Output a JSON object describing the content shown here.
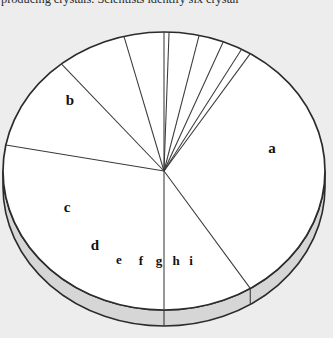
{
  "caption": {
    "text": "producing crystals. Scientists identify six crystal"
  },
  "chart": {
    "title": "",
    "center": {
      "x": 164,
      "y": 171
    },
    "radius_x": 161,
    "radius_y": 139,
    "depth": 16,
    "colors": {
      "top_face": "#ffffff",
      "rim_face": "#d6d6d6",
      "outline": "#2b2b2b",
      "divider": "#3a3a3a",
      "background": "#ededed"
    }
  },
  "chart_data": {
    "type": "pie",
    "title": "",
    "xlabel": "",
    "ylabel": "",
    "legend": "none",
    "start_angle_deg": -90,
    "direction": "clockwise",
    "labels": [
      "a",
      "b",
      "c",
      "d",
      "e",
      "f",
      "g",
      "h",
      "i"
    ],
    "values": [
      41,
      28,
      11,
      7,
      4.5,
      3,
      2.5,
      2,
      1
    ],
    "slices": [
      {
        "label": "a",
        "value": 41,
        "start_deg": -90,
        "end_deg": 57.6,
        "label_x": 272,
        "label_y": 153
      },
      {
        "label": "b",
        "value": 28,
        "start_deg": 90,
        "end_deg": 190.8,
        "label_x": 70,
        "label_y": 105
      },
      {
        "label": "c",
        "value": 11,
        "start_deg": 190.8,
        "end_deg": 230.4,
        "label_x": 67,
        "label_y": 212
      },
      {
        "label": "d",
        "value": 7,
        "start_deg": 230.4,
        "end_deg": 255.6,
        "label_x": 95,
        "label_y": 250
      },
      {
        "label": "e",
        "value": 4.5,
        "start_deg": 255.6,
        "end_deg": 271.8,
        "label_x": 119,
        "label_y": 264
      },
      {
        "label": "f",
        "value": 3,
        "start_deg": 271.8,
        "end_deg": 282.6,
        "label_x": 141,
        "label_y": 265
      },
      {
        "label": "g",
        "value": 2.5,
        "start_deg": 282.6,
        "end_deg": 291.6,
        "label_x": 159,
        "label_y": 265
      },
      {
        "label": "h",
        "value": 2,
        "start_deg": 291.6,
        "end_deg": 298.8,
        "label_x": 176,
        "label_y": 265
      },
      {
        "label": "i",
        "value": 1,
        "start_deg": 298.8,
        "end_deg": 302.4,
        "label_x": 191,
        "label_y": 265
      }
    ]
  }
}
